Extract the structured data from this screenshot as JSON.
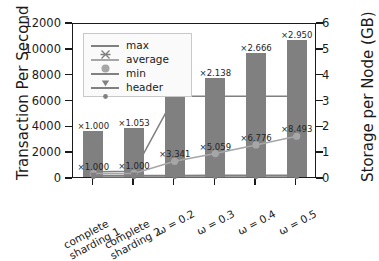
{
  "chart_data": {
    "type": "bar",
    "title": "",
    "xlabel": "",
    "ylabel": "Transaction Per Second",
    "ylabel_right": "Storage per Node (GB)",
    "categories": [
      "complete\nsharding 1",
      "complete\nsharding 2",
      "ω = 0.2",
      "ω = 0.3",
      "ω = 0.4",
      "ω = 0.5"
    ],
    "category_labels": [
      "complete sharding 1",
      "complete sharding 2",
      "ω = 0.2",
      "ω = 0.3",
      "ω = 0.4",
      "ω = 0.5"
    ],
    "ylim": [
      0,
      12000
    ],
    "ylim_right": [
      0,
      6
    ],
    "yticks": [
      0,
      2000,
      4000,
      6000,
      8000,
      10000,
      12000
    ],
    "yticks_right": [
      0,
      1,
      2,
      3,
      4,
      5,
      6
    ],
    "ytick_labels": [
      "0",
      "2000",
      "4000",
      "6000",
      "8000",
      "10000",
      "12000"
    ],
    "ytick_labels_right": [
      "0",
      "1",
      "2",
      "3",
      "4",
      "5",
      "6"
    ],
    "grid": false,
    "legend_position": "upper left",
    "bars": {
      "name": "Transaction Per Second",
      "color": "#808080",
      "values": [
        3600,
        3790,
        6330,
        7690,
        9590,
        10610
      ]
    },
    "series": [
      {
        "name": "max",
        "marker": "x",
        "color": "#808080",
        "axis": "left",
        "values": [
          560,
          600,
          6400,
          6400,
          6400,
          6400
        ]
      },
      {
        "name": "average",
        "marker": "o",
        "color": "#a6a6a6",
        "axis": "left",
        "values": [
          420,
          430,
          1370,
          1970,
          2640,
          3310
        ]
      },
      {
        "name": "min",
        "marker": "v",
        "color": "#808080",
        "axis": "left",
        "values": [
          270,
          275,
          280,
          285,
          290,
          295
        ]
      },
      {
        "name": "header",
        "marker": "o-small",
        "color": "#808080",
        "axis": "left",
        "values": [
          150,
          152,
          155,
          158,
          160,
          163
        ]
      }
    ],
    "annotations": {
      "bar_top_labels": [
        "×1.000",
        "×1.053",
        "×1.760",
        "×2.138",
        "×2.666",
        "×2.950"
      ],
      "average_labels": [
        "×1.000",
        "×1.000",
        "×3.341",
        "×5.059",
        "×6.776",
        "×8.493"
      ]
    }
  },
  "legend": {
    "items": [
      {
        "label": "max"
      },
      {
        "label": "average"
      },
      {
        "label": "min"
      },
      {
        "label": "header"
      }
    ]
  },
  "colors": {
    "bar": "#808080",
    "average_line": "#a6a6a6",
    "max_line": "#808080",
    "axis": "#1a1a1a",
    "legend_bg": "#fafafa",
    "legend_border": "#c8c8c8"
  }
}
